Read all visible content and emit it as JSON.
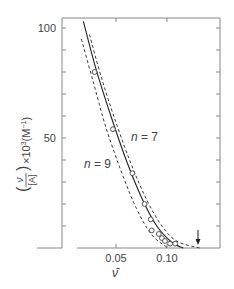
{
  "chart_data": {
    "type": "scatter",
    "title": "",
    "xlabel": "ν̄",
    "ylabel": "(ν̄/[A]) × 10³ (M⁻¹)",
    "ylabel_parts": {
      "numerator": "ν̄",
      "denominator": "[A]",
      "factor": "×10",
      "exp": "3",
      "unit": "(M",
      "unit_exp": "−1",
      "unit_close": ")"
    },
    "xlim": [
      0,
      0.152
    ],
    "ylim": [
      0,
      105
    ],
    "x_ticks": [
      0.05,
      0.1
    ],
    "x_tick_labels": [
      "0.05",
      "0.10"
    ],
    "y_ticks": [
      50,
      100
    ],
    "y_tick_labels": [
      "50",
      "100"
    ],
    "grid": false,
    "annotations": [
      {
        "text_var": "n",
        "text_eq": " = 7",
        "label": "n = 7",
        "x": 0.065,
        "y": 50
      },
      {
        "text_var": "n",
        "text_eq": " = 9",
        "label": "n = 9",
        "x": 0.019,
        "y": 29
      },
      {
        "type": "arrow",
        "label": "arrow",
        "x": 0.13,
        "y_from": 8,
        "y_to": 1
      }
    ],
    "series": [
      {
        "name": "data points",
        "kind": "scatter",
        "marker": "open-circle",
        "points": [
          [
            0.029,
            80
          ],
          [
            0.047,
            54
          ],
          [
            0.066,
            34
          ],
          [
            0.078,
            20
          ],
          [
            0.084,
            13
          ],
          [
            0.085,
            8
          ],
          [
            0.092,
            6.4
          ],
          [
            0.095,
            4.5
          ],
          [
            0.098,
            3.2
          ],
          [
            0.103,
            2
          ],
          [
            0.108,
            2
          ]
        ]
      },
      {
        "name": "fit",
        "kind": "line",
        "style": "solid",
        "points": [
          [
            0.018,
            103
          ],
          [
            0.03,
            82
          ],
          [
            0.045,
            60
          ],
          [
            0.06,
            40
          ],
          [
            0.075,
            23
          ],
          [
            0.09,
            10
          ],
          [
            0.105,
            2.5
          ],
          [
            0.116,
            0
          ]
        ]
      },
      {
        "name": "n = 9",
        "kind": "line",
        "style": "dashed",
        "points": [
          [
            0.016,
            95
          ],
          [
            0.028,
            75
          ],
          [
            0.04,
            55
          ],
          [
            0.055,
            35
          ],
          [
            0.07,
            18
          ],
          [
            0.085,
            6
          ],
          [
            0.101,
            0
          ]
        ]
      },
      {
        "name": "n = 7",
        "kind": "line",
        "style": "dashed",
        "points": [
          [
            0.024,
            97
          ],
          [
            0.036,
            77
          ],
          [
            0.05,
            57
          ],
          [
            0.065,
            38
          ],
          [
            0.08,
            22
          ],
          [
            0.095,
            10
          ],
          [
            0.11,
            3
          ],
          [
            0.132,
            0
          ]
        ]
      }
    ]
  }
}
